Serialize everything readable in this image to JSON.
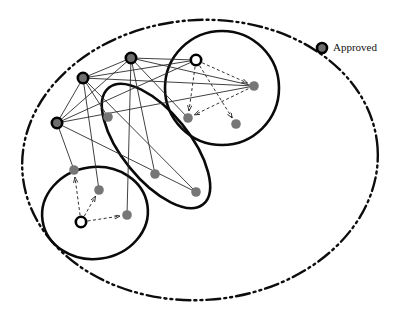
{
  "figure": {
    "background_color": "#ffffff",
    "width": 406,
    "height": 315
  },
  "legend": {
    "items": [
      {
        "id": "legend-approved",
        "label": "Approved",
        "marker": "approved-node-icon",
        "marker_fill": "#6e6e6e",
        "marker_stroke": "#000000",
        "x": 322,
        "y": 48,
        "r": 5.0,
        "stroke_width": 2.6,
        "label_x": 333,
        "label_y": 48
      }
    ]
  },
  "boundary": {
    "id": "outer-boundary",
    "shape": "ellipse",
    "cx": 200,
    "cy": 160,
    "rx": 178,
    "ry": 140,
    "rotation": -4,
    "stroke": "#0d0d0d",
    "stroke_width": 2.4,
    "dash_pattern": "14 4 2 4 2 4",
    "fill": "none"
  },
  "clusters": [
    {
      "id": "cluster-top-right",
      "name": "cluster-circle-top-right",
      "shape": "ellipse",
      "cx": 222,
      "cy": 88,
      "rx": 57,
      "ry": 57,
      "rotation": 0,
      "stroke": "#0a0a0a",
      "stroke_width": 2.6,
      "fill": "none"
    },
    {
      "id": "cluster-middle",
      "name": "cluster-ellipse-middle",
      "shape": "ellipse",
      "cx": 156,
      "cy": 146,
      "rx": 75,
      "ry": 34,
      "rotation": 51,
      "stroke": "#0a0a0a",
      "stroke_width": 2.6,
      "fill": "none"
    },
    {
      "id": "cluster-bottom-left",
      "name": "cluster-circle-bottom-left",
      "shape": "ellipse",
      "cx": 95,
      "cy": 213,
      "rx": 53,
      "ry": 46,
      "rotation": -8,
      "stroke": "#0a0a0a",
      "stroke_width": 2.6,
      "fill": "none"
    }
  ],
  "node_styles": {
    "approved": {
      "fill": "#6e6e6e",
      "stroke": "#000000",
      "stroke_width": 2.6,
      "r": 5.2
    },
    "plain": {
      "fill": "#767676",
      "stroke": "#767676",
      "stroke_width": 0,
      "r": 4.8
    },
    "hollow": {
      "fill": "#ffffff",
      "stroke": "#000000",
      "stroke_width": 2.6,
      "r": 5.2
    }
  },
  "nodes": [
    {
      "id": "a1",
      "name": "approved-node-a1",
      "type": "approved",
      "x": 131,
      "y": 58
    },
    {
      "id": "a2",
      "name": "approved-node-a2",
      "type": "approved",
      "x": 83,
      "y": 78
    },
    {
      "id": "a3",
      "name": "approved-node-a3",
      "type": "approved",
      "x": 57,
      "y": 123
    },
    {
      "id": "h1",
      "name": "hollow-node-top-right",
      "type": "hollow",
      "x": 196,
      "y": 60
    },
    {
      "id": "h2",
      "name": "hollow-node-bottom-left",
      "type": "hollow",
      "x": 81,
      "y": 222
    },
    {
      "id": "p1",
      "name": "node-p1",
      "type": "plain",
      "x": 254,
      "y": 86
    },
    {
      "id": "p2",
      "name": "node-p2",
      "type": "plain",
      "x": 188,
      "y": 118
    },
    {
      "id": "p3",
      "name": "node-p3",
      "type": "plain",
      "x": 236,
      "y": 124
    },
    {
      "id": "p4",
      "name": "node-p4",
      "type": "plain",
      "x": 108,
      "y": 117
    },
    {
      "id": "p5",
      "name": "node-p5",
      "type": "plain",
      "x": 155,
      "y": 174
    },
    {
      "id": "p6",
      "name": "node-p6",
      "type": "plain",
      "x": 196,
      "y": 192
    },
    {
      "id": "p7",
      "name": "node-p7",
      "type": "plain",
      "x": 74,
      "y": 170
    },
    {
      "id": "p8",
      "name": "node-p8",
      "type": "plain",
      "x": 99,
      "y": 190
    },
    {
      "id": "p9",
      "name": "node-p9",
      "type": "plain",
      "x": 127,
      "y": 215
    }
  ],
  "edges_solid": [
    {
      "id": "e1",
      "name": "edge-a1-a2",
      "from": "a1",
      "to": "a2"
    },
    {
      "id": "e2",
      "name": "edge-a1-a3",
      "from": "a1",
      "to": "a3"
    },
    {
      "id": "e3",
      "name": "edge-a2-a3",
      "from": "a2",
      "to": "a3"
    },
    {
      "id": "e4",
      "name": "edge-a1-p1",
      "from": "a1",
      "to": "p1"
    },
    {
      "id": "e5",
      "name": "edge-a2-p1",
      "from": "a2",
      "to": "p1"
    },
    {
      "id": "e6",
      "name": "edge-a3-p1",
      "from": "a3",
      "to": "p1"
    },
    {
      "id": "e7",
      "name": "edge-a1-h1",
      "from": "a1",
      "to": "h1"
    },
    {
      "id": "e8",
      "name": "edge-a2-h1",
      "from": "a2",
      "to": "h1"
    },
    {
      "id": "e9",
      "name": "edge-a3-h1",
      "from": "a3",
      "to": "h1"
    },
    {
      "id": "e10",
      "name": "edge-a1-p2",
      "from": "a1",
      "to": "p2"
    },
    {
      "id": "e11",
      "name": "edge-a1-p5",
      "from": "a1",
      "to": "p5"
    },
    {
      "id": "e12",
      "name": "edge-a1-p9",
      "from": "a1",
      "to": "p9"
    },
    {
      "id": "e13",
      "name": "edge-a2-p4",
      "from": "a2",
      "to": "p4"
    },
    {
      "id": "e14",
      "name": "edge-a2-p8",
      "from": "a2",
      "to": "p8"
    },
    {
      "id": "e15",
      "name": "edge-a3-p7",
      "from": "a3",
      "to": "p7"
    },
    {
      "id": "e16",
      "name": "edge-a3-p6",
      "from": "a3",
      "to": "p6"
    },
    {
      "id": "e17",
      "name": "edge-a2-p6",
      "from": "a2",
      "to": "p6"
    }
  ],
  "edges_dashed": [
    {
      "id": "d1",
      "name": "arrow-h1-p1",
      "from": "h1",
      "to": "p1"
    },
    {
      "id": "d2",
      "name": "arrow-h1-p2",
      "from": "h1",
      "to": "p2"
    },
    {
      "id": "d3",
      "name": "arrow-h1-p3",
      "from": "h1",
      "to": "p3"
    },
    {
      "id": "d4",
      "name": "arrow-p1-p2",
      "from": "p1",
      "to": "p2"
    },
    {
      "id": "d5",
      "name": "arrow-h2-p7",
      "from": "h2",
      "to": "p7"
    },
    {
      "id": "d6",
      "name": "arrow-h2-p8",
      "from": "h2",
      "to": "p8"
    },
    {
      "id": "d7",
      "name": "arrow-h2-p9",
      "from": "h2",
      "to": "p9"
    }
  ],
  "edge_styles": {
    "solid": {
      "stroke": "#2b2b2b",
      "stroke_width": 0.9,
      "dash": "none"
    },
    "dashed": {
      "stroke": "#1a1a1a",
      "stroke_width": 0.9,
      "dash": "3 2.4",
      "arrow": "arrowhead"
    }
  }
}
